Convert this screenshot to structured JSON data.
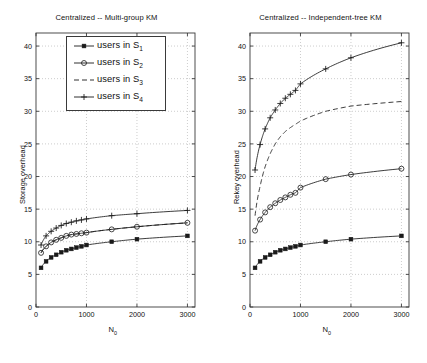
{
  "figure": {
    "panels": [
      {
        "id": "left",
        "title": "Centralized -- Multi-group KM",
        "ylabel": "Storage overhead",
        "xlabel": "N",
        "xlabel_sub": "0"
      },
      {
        "id": "right",
        "title": "Centralized -- Independent-tree KM",
        "ylabel": "Rekey overhead",
        "xlabel": "N",
        "xlabel_sub": "0"
      }
    ],
    "legend": {
      "entries": [
        {
          "label": "users in S",
          "sub": "1",
          "marker": "filled-square",
          "line": "solid"
        },
        {
          "label": "users in S",
          "sub": "2",
          "marker": "open-circle",
          "line": "solid"
        },
        {
          "label": "users in S",
          "sub": "3",
          "marker": "none",
          "line": "dashed"
        },
        {
          "label": "users in S",
          "sub": "4",
          "marker": "plus",
          "line": "solid"
        }
      ]
    }
  },
  "chart_data": [
    {
      "type": "line",
      "panel": "left",
      "title": "Centralized -- Multi-group KM",
      "xlabel": "N_0",
      "ylabel": "Storage overhead",
      "xlim": [
        0,
        3150
      ],
      "ylim": [
        0,
        42
      ],
      "xticks": [
        0,
        1000,
        2000,
        3000
      ],
      "yticks": [
        0,
        5,
        10,
        15,
        20,
        25,
        30,
        35,
        40
      ],
      "grid": true,
      "legend_position": "upper-center",
      "x": [
        100,
        200,
        300,
        400,
        500,
        600,
        700,
        800,
        900,
        1000,
        1500,
        2000,
        3000
      ],
      "series": [
        {
          "name": "users in S_1",
          "marker": "filled-square",
          "line": "solid",
          "values": [
            6.0,
            7.0,
            7.6,
            8.0,
            8.4,
            8.7,
            8.9,
            9.1,
            9.3,
            9.5,
            10.0,
            10.4,
            10.9
          ]
        },
        {
          "name": "users in S_2",
          "marker": "open-circle",
          "line": "solid",
          "values": [
            8.3,
            9.3,
            9.9,
            10.3,
            10.6,
            10.9,
            11.1,
            11.2,
            11.3,
            11.4,
            11.9,
            12.3,
            12.9
          ]
        },
        {
          "name": "users in S_3",
          "marker": "none",
          "line": "dashed",
          "values": [
            8.3,
            9.3,
            9.9,
            10.3,
            10.6,
            10.9,
            11.1,
            11.2,
            11.3,
            11.4,
            11.9,
            12.3,
            12.9
          ]
        },
        {
          "name": "users in S_4",
          "marker": "plus",
          "line": "solid",
          "values": [
            9.5,
            10.9,
            11.6,
            12.1,
            12.5,
            12.8,
            13.0,
            13.2,
            13.35,
            13.5,
            14.0,
            14.3,
            14.8
          ]
        }
      ]
    },
    {
      "type": "line",
      "panel": "right",
      "title": "Centralized -- Independent-tree KM",
      "xlabel": "N_0",
      "ylabel": "Rekey overhead",
      "xlim": [
        0,
        3150
      ],
      "ylim": [
        0,
        42
      ],
      "xticks": [
        0,
        1000,
        2000,
        3000
      ],
      "yticks": [
        0,
        5,
        10,
        15,
        20,
        25,
        30,
        35,
        40
      ],
      "grid": true,
      "legend_position": "none",
      "x": [
        100,
        200,
        300,
        400,
        500,
        600,
        700,
        800,
        900,
        1000,
        1500,
        2000,
        3000
      ],
      "series": [
        {
          "name": "users in S_1",
          "marker": "filled-square",
          "line": "solid",
          "values": [
            6.0,
            7.0,
            7.6,
            8.0,
            8.4,
            8.7,
            8.9,
            9.1,
            9.3,
            9.5,
            10.0,
            10.4,
            10.9
          ]
        },
        {
          "name": "users in S_2",
          "marker": "open-circle",
          "line": "solid",
          "values": [
            11.7,
            13.4,
            14.5,
            15.3,
            15.9,
            16.4,
            16.8,
            17.2,
            17.5,
            18.3,
            19.6,
            20.3,
            21.2
          ]
        },
        {
          "name": "users in S_3",
          "marker": "none",
          "line": "dashed",
          "values": [
            14.0,
            18.5,
            21.5,
            23.5,
            25.0,
            26.1,
            26.9,
            27.5,
            28.0,
            28.5,
            30.0,
            30.8,
            31.5
          ]
        },
        {
          "name": "users in S_4",
          "marker": "plus",
          "line": "solid",
          "values": [
            21.0,
            24.9,
            27.3,
            29.0,
            30.2,
            31.2,
            32.0,
            32.6,
            33.2,
            34.2,
            36.5,
            38.2,
            40.5
          ]
        }
      ]
    }
  ]
}
